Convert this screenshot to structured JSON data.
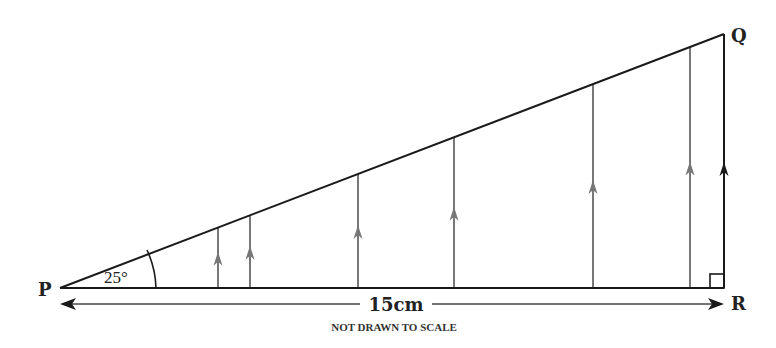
{
  "diagram": {
    "vertices": {
      "P": {
        "label": "P",
        "x": 60,
        "y": 288
      },
      "Q": {
        "label": "Q",
        "x": 724,
        "y": 34
      },
      "R": {
        "label": "R",
        "x": 724,
        "y": 288
      }
    },
    "angle_label": "25°",
    "base_length_label": "15cm",
    "note": "NOT DRAWN TO SCALE",
    "right_angle_at": "R",
    "vertical_lines_x": [
      218,
      250,
      358,
      454,
      593,
      690
    ],
    "colors": {
      "triangle": "#1a1a1a",
      "verticals": "#777777",
      "qr_side": "#1a1a1a",
      "text": "#222222"
    }
  }
}
